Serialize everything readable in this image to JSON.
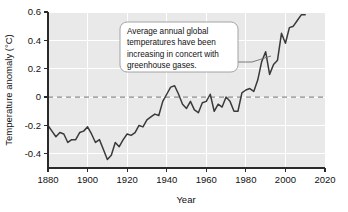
{
  "chart_data": {
    "type": "line",
    "title": "",
    "xlabel": "Year",
    "ylabel": "Temperature anomaly (°C)",
    "xlim": [
      1880,
      2020
    ],
    "ylim": [
      -0.5,
      0.6
    ],
    "xticks": [
      1880,
      1900,
      1920,
      1940,
      1960,
      1980,
      2000,
      2020
    ],
    "xtick_labels": [
      "1880",
      "1900",
      "1920",
      "1940",
      "1960",
      "1980",
      "2000",
      "2020"
    ],
    "yticks": [
      -0.4,
      -0.2,
      0,
      0.2,
      0.4,
      0.6
    ],
    "ytick_labels": [
      "-0.4",
      "-0.2",
      "0",
      "0.2",
      "0.4",
      "0.6"
    ],
    "grid": true,
    "grid_color": "#ffffff",
    "plot_bg": "#e9e9e9",
    "line_color": "#3a3a3a",
    "reference_line": {
      "value": 0,
      "style": "dashed",
      "color": "#8c8c8c"
    },
    "legend": null,
    "series": [
      {
        "name": "Global temperature anomaly",
        "x": [
          1880,
          1882,
          1884,
          1886,
          1888,
          1890,
          1892,
          1894,
          1896,
          1898,
          1900,
          1902,
          1904,
          1906,
          1908,
          1910,
          1912,
          1914,
          1916,
          1918,
          1920,
          1922,
          1924,
          1926,
          1928,
          1930,
          1932,
          1934,
          1936,
          1938,
          1940,
          1942,
          1944,
          1946,
          1948,
          1950,
          1952,
          1954,
          1956,
          1958,
          1960,
          1962,
          1964,
          1966,
          1968,
          1970,
          1972,
          1974,
          1976,
          1978,
          1980,
          1982,
          1984,
          1986,
          1988,
          1990,
          1992,
          1994,
          1996,
          1998,
          2000,
          2002,
          2004,
          2006,
          2008,
          2010
        ],
        "values": [
          -0.2,
          -0.24,
          -0.28,
          -0.25,
          -0.26,
          -0.32,
          -0.3,
          -0.3,
          -0.25,
          -0.24,
          -0.21,
          -0.26,
          -0.32,
          -0.3,
          -0.37,
          -0.44,
          -0.41,
          -0.32,
          -0.35,
          -0.3,
          -0.26,
          -0.27,
          -0.25,
          -0.2,
          -0.21,
          -0.16,
          -0.14,
          -0.12,
          -0.13,
          -0.03,
          0.02,
          0.07,
          0.08,
          0.02,
          -0.05,
          -0.08,
          -0.03,
          -0.09,
          -0.11,
          -0.04,
          -0.03,
          0.02,
          -0.1,
          -0.05,
          -0.07,
          0.0,
          -0.03,
          -0.1,
          -0.1,
          0.03,
          0.05,
          0.06,
          0.04,
          0.12,
          0.25,
          0.32,
          0.16,
          0.23,
          0.26,
          0.45,
          0.38,
          0.49,
          0.5,
          0.54,
          0.58,
          0.58
        ],
        "units": "°C"
      }
    ],
    "annotations": [
      {
        "text_lines": [
          "Average annual global",
          "temperatures have been",
          "increasing in concert with",
          "greenhouse gases."
        ],
        "box_color": "#ffffff",
        "border_color": "#9a9a9a",
        "points_to_year": 1988,
        "points_to_value": 0.25
      }
    ]
  }
}
